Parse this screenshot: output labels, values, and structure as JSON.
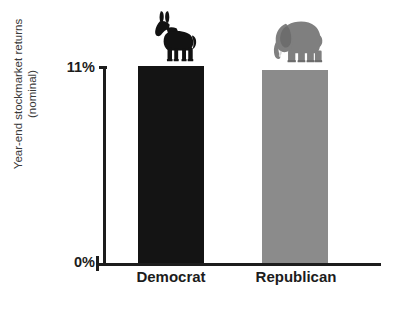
{
  "chart_data": {
    "type": "bar",
    "title": "",
    "categories": [
      "Democrat",
      "Republican"
    ],
    "values": [
      11.0,
      10.8
    ],
    "xlabel": "",
    "ylabel": "Year-end stockmarket returns (nominal)",
    "ylabel_lines": [
      "Year-end stockmarket returns",
      "(nominal)"
    ],
    "ylim": [
      0,
      11
    ],
    "ytick_labels": [
      "11%",
      "0%"
    ],
    "ytick_values": [
      11,
      0
    ],
    "grid": false,
    "legend": null,
    "bar_colors": [
      "#141414",
      "#8b8b8b"
    ],
    "annotations": [
      {
        "name": "donkey-icon",
        "category": "Democrat",
        "meaning": "Democratic Party symbol"
      },
      {
        "name": "elephant-icon",
        "category": "Republican",
        "meaning": "Republican Party symbol"
      }
    ]
  },
  "axis": {
    "y_label_line1": "Year-end stockmarket returns",
    "y_label_line2": "(nominal)",
    "tick_top": "11%",
    "tick_zero": "0%"
  },
  "bars": [
    {
      "label": "Democrat",
      "value": "11.0",
      "color": "#141414"
    },
    {
      "label": "Republican",
      "value": "10.8",
      "color": "#8b8b8b"
    }
  ],
  "icons": {
    "democrat": "donkey-icon",
    "republican": "elephant-icon"
  }
}
